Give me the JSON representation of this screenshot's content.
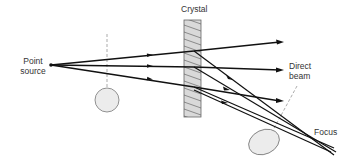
{
  "labels": {
    "crystal": "Crystal",
    "point_source_line1": "Point",
    "point_source_line2": "source",
    "direct_beam_line1": "Direct",
    "direct_beam_line2": "beam",
    "focus": "Focus"
  },
  "colors": {
    "line": "#111111",
    "crystal_fill": "#d9d9d9",
    "crystal_hatch": "#555555",
    "object_fill": "#e8e8e8",
    "object_stroke": "#777777",
    "dashed": "#888888",
    "text": "#333333"
  }
}
